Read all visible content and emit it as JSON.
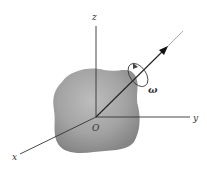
{
  "figure": {
    "labels": {
      "z_axis": "z",
      "y_axis": "y",
      "x_axis": "x",
      "origin": "O",
      "angular_velocity": "ω"
    },
    "colors": {
      "body_fill_light": "#b8b8b8",
      "body_fill_dark": "#8a8a8a",
      "axis_line": "#333333",
      "background": "#ffffff"
    }
  }
}
